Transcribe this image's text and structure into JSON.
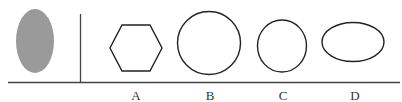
{
  "reference": {
    "shape": "ellipse",
    "fill": "#9a9a9a",
    "orientation": "vertical"
  },
  "options": [
    {
      "label": "A",
      "shape": "hexagon"
    },
    {
      "label": "B",
      "shape": "circle"
    },
    {
      "label": "C",
      "shape": "circle-slightly-oval"
    },
    {
      "label": "D",
      "shape": "horizontal-ellipse"
    }
  ],
  "colors": {
    "stroke": "#222222",
    "axis": "#444444",
    "reference_fill": "#9a9a9a"
  }
}
